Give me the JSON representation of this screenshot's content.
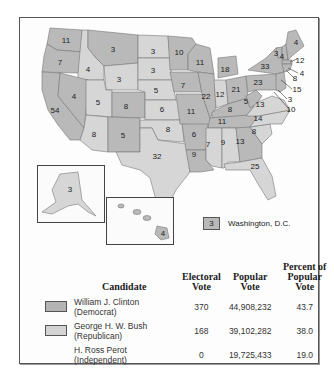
{
  "map": {
    "title": "1992 Presidential Election Electoral Votes",
    "states": [
      {
        "abbr": "WA",
        "ev": 11,
        "party": "dem"
      },
      {
        "abbr": "OR",
        "ev": 7,
        "party": "dem"
      },
      {
        "abbr": "CA",
        "ev": 54,
        "party": "dem"
      },
      {
        "abbr": "ID",
        "ev": 4,
        "party": "rep"
      },
      {
        "abbr": "NV",
        "ev": 4,
        "party": "dem"
      },
      {
        "abbr": "MT",
        "ev": 3,
        "party": "dem"
      },
      {
        "abbr": "WY",
        "ev": 3,
        "party": "rep"
      },
      {
        "abbr": "UT",
        "ev": 5,
        "party": "rep"
      },
      {
        "abbr": "AZ",
        "ev": 8,
        "party": "rep"
      },
      {
        "abbr": "CO",
        "ev": 8,
        "party": "dem"
      },
      {
        "abbr": "NM",
        "ev": 5,
        "party": "dem"
      },
      {
        "abbr": "ND",
        "ev": 3,
        "party": "rep"
      },
      {
        "abbr": "SD",
        "ev": 3,
        "party": "rep"
      },
      {
        "abbr": "NE",
        "ev": 5,
        "party": "rep"
      },
      {
        "abbr": "KS",
        "ev": 6,
        "party": "rep"
      },
      {
        "abbr": "OK",
        "ev": 8,
        "party": "rep"
      },
      {
        "abbr": "TX",
        "ev": 32,
        "party": "rep"
      },
      {
        "abbr": "MN",
        "ev": 10,
        "party": "dem"
      },
      {
        "abbr": "IA",
        "ev": 7,
        "party": "dem"
      },
      {
        "abbr": "MO",
        "ev": 11,
        "party": "dem"
      },
      {
        "abbr": "AR",
        "ev": 6,
        "party": "dem"
      },
      {
        "abbr": "LA",
        "ev": 9,
        "party": "dem"
      },
      {
        "abbr": "WI",
        "ev": 11,
        "party": "dem"
      },
      {
        "abbr": "IL",
        "ev": 22,
        "party": "dem"
      },
      {
        "abbr": "MI",
        "ev": 18,
        "party": "dem"
      },
      {
        "abbr": "IN",
        "ev": 12,
        "party": "rep"
      },
      {
        "abbr": "OH",
        "ev": 21,
        "party": "dem"
      },
      {
        "abbr": "KY",
        "ev": 8,
        "party": "dem"
      },
      {
        "abbr": "TN",
        "ev": 11,
        "party": "dem"
      },
      {
        "abbr": "MS",
        "ev": 7,
        "party": "rep"
      },
      {
        "abbr": "AL",
        "ev": 9,
        "party": "rep"
      },
      {
        "abbr": "GA",
        "ev": 13,
        "party": "dem"
      },
      {
        "abbr": "FL",
        "ev": 25,
        "party": "rep"
      },
      {
        "abbr": "SC",
        "ev": 8,
        "party": "rep"
      },
      {
        "abbr": "NC",
        "ev": 14,
        "party": "rep"
      },
      {
        "abbr": "VA",
        "ev": 13,
        "party": "rep"
      },
      {
        "abbr": "WV",
        "ev": 5,
        "party": "dem"
      },
      {
        "abbr": "PA",
        "ev": 23,
        "party": "dem"
      },
      {
        "abbr": "NY",
        "ev": 33,
        "party": "dem"
      },
      {
        "abbr": "VT",
        "ev": 3,
        "party": "dem"
      },
      {
        "abbr": "NH",
        "ev": 4,
        "party": "dem"
      },
      {
        "abbr": "ME",
        "ev": 4,
        "party": "dem"
      },
      {
        "abbr": "MA",
        "ev": 12,
        "party": "dem"
      },
      {
        "abbr": "RI",
        "ev": 4,
        "party": "dem"
      },
      {
        "abbr": "CT",
        "ev": 8,
        "party": "dem"
      },
      {
        "abbr": "NJ",
        "ev": 15,
        "party": "dem"
      },
      {
        "abbr": "DE",
        "ev": 3,
        "party": "dem"
      },
      {
        "abbr": "MD",
        "ev": 10,
        "party": "dem"
      },
      {
        "abbr": "AK",
        "ev": 3,
        "party": "rep"
      },
      {
        "abbr": "HI",
        "ev": 4,
        "party": "dem"
      }
    ],
    "labels": {
      "WA": "11",
      "OR": "7",
      "CA": "54",
      "ID": "4",
      "NV": "4",
      "MT": "3",
      "WY": "3",
      "UT": "5",
      "AZ": "8",
      "CO": "8",
      "NM": "5",
      "ND": "3",
      "SD": "3",
      "NE": "5",
      "KS": "6",
      "OK": "8",
      "TX": "32",
      "MN": "10",
      "IA": "7",
      "MO": "11",
      "AR": "6",
      "LA": "9",
      "WI": "11",
      "IL": "22",
      "MI": "18",
      "IN": "12",
      "OH": "21",
      "KY": "8",
      "TN": "11",
      "MS": "7",
      "AL": "9",
      "GA": "13",
      "FL": "25",
      "SC": "8",
      "NC": "14",
      "VA": "13",
      "WV": "5",
      "PA": "23",
      "NY": "33",
      "VT": "3",
      "NH": "4",
      "ME": "4",
      "MA": "12",
      "RI": "4",
      "CT": "8",
      "NJ": "15",
      "DE": "3",
      "MD": "10",
      "AK": "3",
      "HI": "4"
    },
    "dc": {
      "ev": "3",
      "label": "Washington, D.C."
    }
  },
  "table": {
    "headers": {
      "candidate": "Candidate",
      "electoral_1": "Electoral",
      "electoral_2": "Vote",
      "popular_1": "Popular",
      "popular_2": "Vote",
      "percent_1": "Percent of",
      "percent_2": "Popular Vote"
    },
    "rows": [
      {
        "name": "William J. Clinton",
        "party": "(Democrat)",
        "electoral": "370",
        "popular": "44,908,232",
        "percent": "43.7",
        "swatch": "dem"
      },
      {
        "name": "George H. W. Bush",
        "party": "(Republican)",
        "electoral": "168",
        "popular": "39,102,282",
        "percent": "38.0",
        "swatch": "rep"
      },
      {
        "name": "H. Ross Perot",
        "party": "(Independent)",
        "electoral": "0",
        "popular": "19,725,433",
        "percent": "19.0",
        "swatch": "none"
      }
    ]
  },
  "colors": {
    "democrat": "#b9b9b9",
    "republican": "#d6d6d6",
    "border": "#777777"
  }
}
